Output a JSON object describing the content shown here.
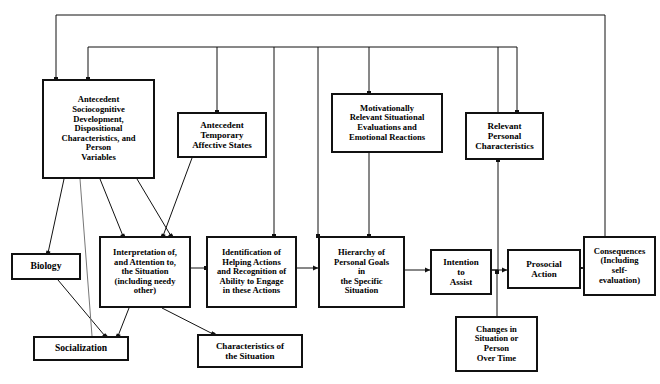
{
  "diagram": {
    "stroke_color": "#111111",
    "background": "#ffffff",
    "nodes": [
      {
        "id": "antecedent_sociocognitive",
        "label": "Antecedent\nSociocognitive\nDevelopment,\nDispositional\nCharacteristics, and\nPerson\nVariables",
        "x": 42,
        "y": 79,
        "w": 113,
        "h": 100,
        "size": "s85"
      },
      {
        "id": "antecedent_temporary",
        "label": "Antecedent\nTemporary\nAffective States",
        "x": 177,
        "y": 112,
        "w": 90,
        "h": 46,
        "size": "s9"
      },
      {
        "id": "motivationally_relevant",
        "label": "Motivationally\nRelevant Situational\nEvaluations and\nEmotional Reactions",
        "x": 331,
        "y": 93,
        "w": 112,
        "h": 60,
        "size": "s85"
      },
      {
        "id": "relevant_personal",
        "label": "Relevant\nPersonal\nCharacteristics",
        "x": 465,
        "y": 112,
        "w": 79,
        "h": 48,
        "size": "s9"
      },
      {
        "id": "biology",
        "label": "Biology",
        "x": 11,
        "y": 253,
        "w": 70,
        "h": 27,
        "size": "s10"
      },
      {
        "id": "socialization",
        "label": "Socialization",
        "x": 33,
        "y": 336,
        "w": 96,
        "h": 25,
        "size": "s10"
      },
      {
        "id": "interpretation",
        "label": "Interpretation of,\nand Attention to,\nthe Situation\n(including needy\nother)",
        "x": 99,
        "y": 236,
        "w": 92,
        "h": 72,
        "size": "s85"
      },
      {
        "id": "characteristics_situation",
        "label": "Characteristics of\nthe Situation",
        "x": 197,
        "y": 334,
        "w": 106,
        "h": 34,
        "size": "s9"
      },
      {
        "id": "identification_helping",
        "label": "Identification of\nHelping Actions\nand Recognition of\nAbility to Engage\nin these Actions",
        "x": 206,
        "y": 236,
        "w": 91,
        "h": 72,
        "size": "s85"
      },
      {
        "id": "hierarchy_goals",
        "label": "Hierarchy of\nPersonal Goals\nin\nthe Specific\nSituation",
        "x": 318,
        "y": 236,
        "w": 87,
        "h": 72,
        "size": "s85"
      },
      {
        "id": "intention_assist",
        "label": "Intention\nto\nAssist",
        "x": 430,
        "y": 249,
        "w": 62,
        "h": 46,
        "size": "s9"
      },
      {
        "id": "prosocial_action",
        "label": "Prosocial\nAction",
        "x": 507,
        "y": 249,
        "w": 74,
        "h": 40,
        "size": "s9"
      },
      {
        "id": "consequences",
        "label": "Consequences\n(Including\nself-\nevaluation)",
        "x": 583,
        "y": 236,
        "w": 73,
        "h": 60,
        "size": "s85"
      },
      {
        "id": "changes_situation",
        "label": "Changes in\nSituation or\nPerson\nOver Time",
        "x": 455,
        "y": 316,
        "w": 83,
        "h": 56,
        "size": "s85"
      }
    ],
    "connections": [
      {
        "id": "consequences-to-antecedent-sociocognitive",
        "kind": "feedback-outer"
      },
      {
        "id": "consequences-to-relevant-personal",
        "kind": "feedback-inner"
      },
      {
        "id": "feedback-to-antecedent-temporary",
        "kind": "feedback-inner"
      },
      {
        "id": "feedback-to-interpretation",
        "kind": "feedback-inner"
      },
      {
        "id": "feedback-to-identification",
        "kind": "feedback-inner"
      },
      {
        "id": "feedback-to-motivationally-relevant",
        "kind": "feedback-inner"
      },
      {
        "id": "antecedent-sociocognitive-to-biology",
        "kind": "direct"
      },
      {
        "id": "antecedent-sociocognitive-to-interpretation",
        "kind": "direct"
      },
      {
        "id": "antecedent-sociocognitive-to-identification",
        "kind": "direct"
      },
      {
        "id": "biology-to-socialization",
        "kind": "direct"
      },
      {
        "id": "socialization-to-antecedent-sociocognitive",
        "kind": "direct"
      },
      {
        "id": "interpretation-to-socialization",
        "kind": "direct"
      },
      {
        "id": "interpretation-to-characteristics",
        "kind": "direct"
      },
      {
        "id": "antecedent-temporary-to-interpretation",
        "kind": "direct"
      },
      {
        "id": "interpretation-to-identification",
        "kind": "direct"
      },
      {
        "id": "identification-to-hierarchy",
        "kind": "direct"
      },
      {
        "id": "motivationally-relevant-to-hierarchy",
        "kind": "direct"
      },
      {
        "id": "hierarchy-to-intention",
        "kind": "direct"
      },
      {
        "id": "relevant-personal-to-intention",
        "kind": "direct"
      },
      {
        "id": "intention-to-prosocial-action",
        "kind": "direct"
      },
      {
        "id": "prosocial-action-to-consequences",
        "kind": "direct"
      },
      {
        "id": "prosocial-action-to-changes",
        "kind": "direct"
      },
      {
        "id": "changes-to-intention",
        "kind": "direct"
      }
    ]
  }
}
